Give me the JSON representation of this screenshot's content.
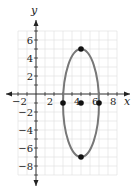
{
  "chart_data": {
    "type": "scatter",
    "title": "",
    "xlabel": "x",
    "ylabel": "y",
    "xlim": [
      -2,
      9
    ],
    "ylim": [
      -9,
      7
    ],
    "grid": true,
    "x_tick_labels": [
      "−2",
      "2",
      "4",
      "6",
      "8"
    ],
    "y_tick_labels": [
      "6",
      "4",
      "2",
      "−2",
      "−4",
      "−6",
      "−8"
    ],
    "ellipse": {
      "center": [
        5,
        -1
      ],
      "rx": 2,
      "ry": 6,
      "color": "#777777"
    },
    "points": [
      {
        "x": 5,
        "y": 5
      },
      {
        "x": 5,
        "y": -7
      },
      {
        "x": 3,
        "y": -1
      },
      {
        "x": 5,
        "y": -1
      },
      {
        "x": 7,
        "y": -1
      }
    ]
  },
  "labels": {
    "x_axis": "x",
    "y_axis": "y"
  }
}
